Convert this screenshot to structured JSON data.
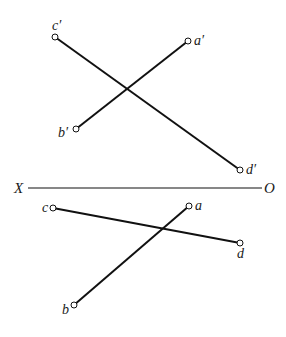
{
  "diagram": {
    "type": "orthographic-projection-two-lines",
    "axis": {
      "left_label": "X",
      "right_label": "O"
    },
    "front_view": {
      "points": [
        {
          "name": "c'",
          "x": 55,
          "y": 37
        },
        {
          "name": "a'",
          "x": 188,
          "y": 41
        },
        {
          "name": "b'",
          "x": 76,
          "y": 129
        },
        {
          "name": "d'",
          "x": 240,
          "y": 170
        }
      ],
      "lines": [
        [
          "c'",
          "d'"
        ],
        [
          "a'",
          "b'"
        ]
      ]
    },
    "top_view": {
      "points": [
        {
          "name": "c",
          "x": 53,
          "y": 208
        },
        {
          "name": "a",
          "x": 189,
          "y": 206
        },
        {
          "name": "d",
          "x": 240,
          "y": 243
        },
        {
          "name": "b",
          "x": 74,
          "y": 305
        }
      ],
      "lines": [
        [
          "c",
          "d"
        ],
        [
          "a",
          "b"
        ]
      ]
    },
    "colors": {
      "stroke": "#111111",
      "background": "#ffffff"
    }
  },
  "labels": {
    "c_prime": "c′",
    "a_prime": "a′",
    "b_prime": "b′",
    "d_prime": "d′",
    "c": "c",
    "a": "a",
    "d": "d",
    "b": "b",
    "X": "X",
    "O": "O"
  }
}
